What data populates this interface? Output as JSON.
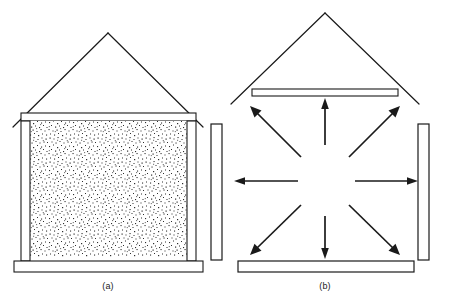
{
  "figure": {
    "background_color": "#ffffff",
    "line_color": "#1a1a1a",
    "fill_color": "#ffffff",
    "stipple_color": "#3a3a3a",
    "width": 450,
    "height": 302
  },
  "panels": [
    {
      "id": "a",
      "caption": "(a)",
      "description": "House cross-section with stippled granular fill between walls, gabled roof, top beam, bottom beam, and a detached vertical panel at right",
      "elements": {
        "roof_label": "gable-roof",
        "top_beam_label": "top-beam",
        "left_wall_label": "left-wall",
        "right_wall_label": "right-wall",
        "bottom_beam_label": "bottom-beam",
        "fill_label": "stippled-fill",
        "detached_panel_label": "detached-side-panel"
      }
    },
    {
      "id": "b",
      "caption": "(b)",
      "description": "Same structure with interior empty and eight arrows radiating outward from the center toward the enclosing members",
      "elements": {
        "roof_label": "gable-roof",
        "top_beam_label": "top-beam",
        "bottom_beam_label": "bottom-beam",
        "detached_panel_label": "detached-side-panel",
        "arrow_count": 8,
        "arrow_directions": [
          "up",
          "down",
          "left",
          "right",
          "up-left",
          "up-right",
          "down-left",
          "down-right"
        ]
      }
    }
  ],
  "captions": {
    "a": "(a)",
    "b": "(b)"
  }
}
